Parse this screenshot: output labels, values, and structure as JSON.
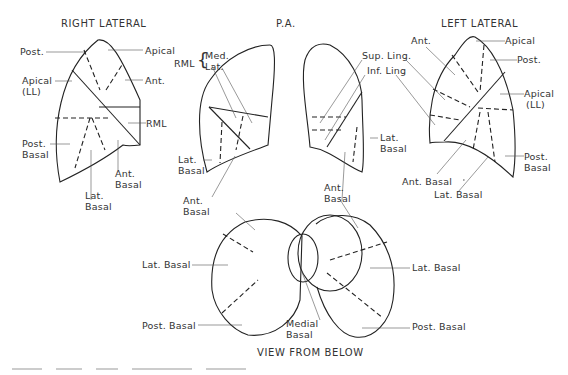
{
  "views": {
    "right_lateral": {
      "title": "RIGHT LATERAL",
      "labels": {
        "post": "Post.",
        "apical": "Apical",
        "apical_ll_1": "Apical",
        "apical_ll_2": "(LL)",
        "ant": "Ant.",
        "rml": "RML",
        "post_basal_1": "Post.",
        "post_basal_2": "Basal",
        "ant_basal_1": "Ant.",
        "ant_basal_2": "Basal",
        "lat_basal_1": "Lat.",
        "lat_basal_2": "Basal"
      }
    },
    "pa": {
      "title": "P.A.",
      "labels": {
        "rml": "RML",
        "med": "Med.",
        "lat": "Lat.",
        "lat_basal_r_1": "Lat.",
        "lat_basal_r_2": "Basal",
        "ant_basal_r_1": "Ant.",
        "ant_basal_r_2": "Basal",
        "sup_ling": "Sup. Ling.",
        "inf_ling": "Inf. Ling",
        "lat_basal_l_1": "Lat.",
        "lat_basal_l_2": "Basal",
        "ant_basal_l_1": "Ant.",
        "ant_basal_l_2": "Basal"
      }
    },
    "left_lateral": {
      "title": "LEFT LATERAL",
      "labels": {
        "ant": "Ant.",
        "apical": "Apical",
        "post": "Post.",
        "apical_ll_1": "Apical",
        "apical_ll_2": "(LL)",
        "post_basal_1": "Post.",
        "post_basal_2": "Basal",
        "ant_basal": "Ant. Basal",
        "lat_basal": "Lat. Basal"
      }
    },
    "below": {
      "title": "VIEW FROM BELOW",
      "labels": {
        "lat_basal_left": "Lat. Basal",
        "post_basal_left": "Post. Basal",
        "medial_basal_1": "Medial",
        "medial_basal_2": "Basal",
        "lat_basal_right": "Lat. Basal",
        "post_basal_right": "Post. Basal"
      }
    }
  },
  "colors": {
    "line": "#222222",
    "leader": "#555555",
    "text": "#333333"
  }
}
